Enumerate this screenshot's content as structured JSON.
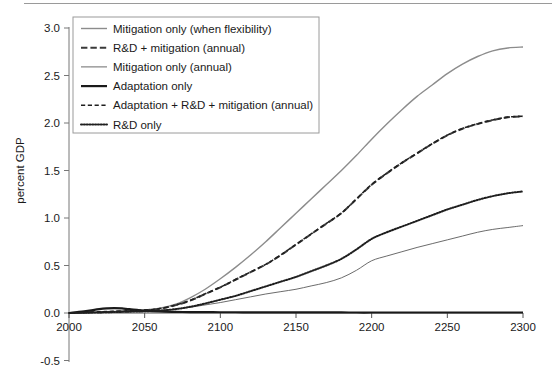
{
  "chart_data": {
    "type": "line",
    "title": "",
    "xlabel": "",
    "ylabel": "percent GDP",
    "xlim": [
      2000,
      2300
    ],
    "ylim": [
      -0.5,
      3.0
    ],
    "grid": false,
    "legend_position": "upper-left",
    "xticks": [
      2000,
      2050,
      2100,
      2150,
      2200,
      2250,
      2300
    ],
    "xtick_labels": [
      "2000",
      "2050",
      "2100",
      "2150",
      "2200",
      "2250",
      "2300"
    ],
    "yticks": [
      -0.5,
      0.0,
      0.5,
      1.0,
      1.5,
      2.0,
      2.5,
      3.0
    ],
    "ytick_labels": [
      "-0.5",
      "0.0",
      "0.5",
      "1.0",
      "1.5",
      "2.0",
      "2.5",
      "3.0"
    ],
    "x": [
      2000,
      2010,
      2020,
      2025,
      2030,
      2035,
      2040,
      2050,
      2060,
      2070,
      2080,
      2090,
      2100,
      2110,
      2120,
      2130,
      2140,
      2150,
      2160,
      2170,
      2180,
      2190,
      2200,
      2210,
      2220,
      2230,
      2240,
      2250,
      2260,
      2270,
      2280,
      2290,
      2300
    ],
    "series": [
      {
        "name": "Mitigation only (when flexibility)",
        "style": "solid",
        "color": "#8c8c8c",
        "width": 1.4,
        "values": [
          0.0,
          0.005,
          0.01,
          0.012,
          0.015,
          0.018,
          0.022,
          0.03,
          0.05,
          0.09,
          0.16,
          0.25,
          0.36,
          0.48,
          0.61,
          0.75,
          0.9,
          1.05,
          1.2,
          1.35,
          1.5,
          1.66,
          1.83,
          1.99,
          2.14,
          2.28,
          2.4,
          2.52,
          2.62,
          2.7,
          2.76,
          2.79,
          2.8
        ]
      },
      {
        "name": "R&D + mitigation (annual)",
        "style": "dashed",
        "color": "#3a3a3a",
        "width": 2.0,
        "values": [
          0.0,
          0.004,
          0.009,
          0.011,
          0.014,
          0.017,
          0.021,
          0.028,
          0.045,
          0.08,
          0.13,
          0.2,
          0.27,
          0.35,
          0.43,
          0.51,
          0.61,
          0.72,
          0.83,
          0.94,
          1.05,
          1.2,
          1.35,
          1.47,
          1.58,
          1.68,
          1.78,
          1.87,
          1.94,
          1.99,
          2.03,
          2.06,
          2.07
        ]
      },
      {
        "name": "Mitigation only (annual)",
        "style": "solid",
        "color": "#5a5a5a",
        "width": 0.9,
        "values": [
          0.0,
          0.003,
          0.007,
          0.009,
          0.011,
          0.013,
          0.016,
          0.02,
          0.028,
          0.04,
          0.06,
          0.085,
          0.11,
          0.14,
          0.17,
          0.2,
          0.225,
          0.25,
          0.285,
          0.32,
          0.37,
          0.45,
          0.55,
          0.6,
          0.645,
          0.69,
          0.73,
          0.77,
          0.81,
          0.85,
          0.88,
          0.9,
          0.92
        ]
      },
      {
        "name": "Adaptation only",
        "style": "solid",
        "color": "#1a1a1a",
        "width": 2.2,
        "values": [
          0.0,
          0.018,
          0.04,
          0.048,
          0.052,
          0.048,
          0.04,
          0.025,
          0.016,
          0.012,
          0.01,
          0.009,
          0.008,
          0.008,
          0.007,
          0.007,
          0.007,
          0.006,
          0.006,
          0.006,
          0.006,
          0.005,
          0.005,
          0.005,
          0.005,
          0.005,
          0.005,
          0.005,
          0.005,
          0.005,
          0.005,
          0.005,
          0.005
        ]
      },
      {
        "name": "Adaptation + R&D + mitigation (annual)",
        "style": "shortdash",
        "color": "#1f1f1f",
        "width": 1.6,
        "values": [
          0.0,
          0.006,
          0.012,
          0.015,
          0.018,
          0.02,
          0.024,
          0.03,
          0.047,
          0.082,
          0.132,
          0.202,
          0.272,
          0.352,
          0.432,
          0.512,
          0.612,
          0.722,
          0.832,
          0.942,
          1.052,
          1.202,
          1.352,
          1.472,
          1.582,
          1.682,
          1.782,
          1.872,
          1.942,
          1.992,
          2.032,
          2.062,
          2.072
        ]
      },
      {
        "name": "R&D only",
        "style": "dotted",
        "color": "#1f1f1f",
        "width": 2.0,
        "values": [
          0.0,
          0.003,
          0.006,
          0.008,
          0.01,
          0.012,
          0.014,
          0.018,
          0.025,
          0.04,
          0.065,
          0.1,
          0.14,
          0.18,
          0.23,
          0.28,
          0.33,
          0.38,
          0.44,
          0.5,
          0.57,
          0.67,
          0.78,
          0.85,
          0.91,
          0.97,
          1.03,
          1.09,
          1.14,
          1.19,
          1.23,
          1.26,
          1.28
        ]
      }
    ]
  },
  "legend": {
    "items": [
      {
        "label": "Mitigation only (when flexibility)"
      },
      {
        "label": "R&D + mitigation (annual)"
      },
      {
        "label": "Mitigation only (annual)"
      },
      {
        "label": "Adaptation only"
      },
      {
        "label": "Adaptation + R&D + mitigation (annual)"
      },
      {
        "label": "R&D only"
      }
    ]
  }
}
